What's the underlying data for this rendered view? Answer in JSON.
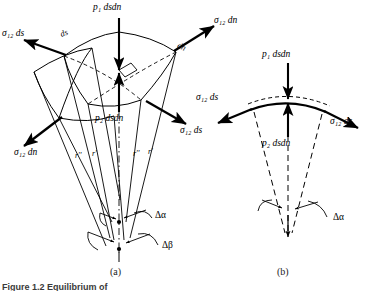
{
  "figure": {
    "panel_a_label": "(a)",
    "panel_b_label": "(b)",
    "caption": "Figure 1.2  Equilibrium of"
  },
  "panel_a": {
    "top_force": "p₁ dsdn",
    "bottom_force": "p₂ dsdn",
    "edge_ds": "ds",
    "edge_dn": "dn",
    "tension_left_ds": "σ₁₂ ds",
    "tension_right_dn": "σ₁₂ dn",
    "tension_right_ds": "σ₁₂ ds",
    "tension_left_dn": "σ₁₂ dn",
    "radius_left_double": "r''",
    "radius_left_single": "r'",
    "radius_right_double": "r''",
    "radius_right_single": "r'",
    "angle_alpha": "Δα",
    "angle_beta": "Δβ"
  },
  "panel_b": {
    "top_force": "p₁ dsdn",
    "bottom_force": "p₂ dsdn",
    "tension_left": "σ₁₂ ds",
    "tension_right": "σ₁₂ ds",
    "angle_alpha": "Δα"
  },
  "style": {
    "stroke": "#000000",
    "background": "#ffffff"
  }
}
